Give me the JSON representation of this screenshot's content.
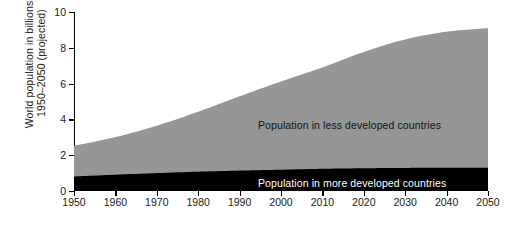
{
  "chart_data": {
    "type": "area",
    "title": "",
    "subtitle": "",
    "xlabel": "",
    "ylabel": "World population in billions, 1950–2050 (projected)",
    "ylabel_line1": "World population in billions,",
    "ylabel_line2": "1950–2050 (projected)",
    "stacked": true,
    "grid": false,
    "legend_position": "in-plot",
    "xlim": [
      1950,
      2050
    ],
    "ylim": [
      0,
      10
    ],
    "x_ticks": [
      1950,
      1960,
      1970,
      1980,
      1990,
      2000,
      2010,
      2020,
      2030,
      2040,
      2050
    ],
    "x_tick_labels": [
      "1950",
      "1960",
      "1970",
      "1980",
      "1990",
      "2000",
      "2010",
      "2020",
      "2030",
      "2040",
      "2050"
    ],
    "y_ticks": [
      0,
      2,
      4,
      6,
      8,
      10
    ],
    "y_tick_labels": [
      "0",
      "2",
      "4",
      "6",
      "8",
      "10"
    ],
    "x": [
      1950,
      1960,
      1970,
      1980,
      1990,
      2000,
      2010,
      2020,
      2030,
      2040,
      2050
    ],
    "series": [
      {
        "name": "Population in more developed countries",
        "color": "#000000",
        "label_color": "#ffffff",
        "values": [
          0.81,
          0.91,
          1.0,
          1.08,
          1.14,
          1.19,
          1.24,
          1.27,
          1.29,
          1.3,
          1.3
        ]
      },
      {
        "name": "Population in less developed countries",
        "color": "#969696",
        "label_color": "#111111",
        "values": [
          1.72,
          2.1,
          2.65,
          3.35,
          4.15,
          4.93,
          5.66,
          6.5,
          7.18,
          7.6,
          7.8
        ]
      }
    ],
    "totals": [
      2.53,
      3.01,
      3.65,
      4.43,
      5.29,
      6.12,
      6.9,
      7.77,
      8.47,
      8.9,
      9.1
    ],
    "annotations": [
      {
        "text": "Population in less developed countries",
        "color": "#111111"
      },
      {
        "text": "Population in more developed countries",
        "color": "#ffffff"
      }
    ],
    "colors": {
      "less_developed": "#969696",
      "more_developed": "#000000",
      "axis": "#000000",
      "text": "#1a1a1a",
      "background": "#ffffff"
    }
  }
}
